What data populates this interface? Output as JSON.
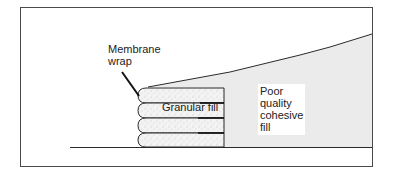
{
  "diagram": {
    "title": "",
    "labels": {
      "membrane": [
        "Membrane",
        "wrap"
      ],
      "granular": "Granular fill",
      "cohesive": [
        "Poor",
        "quality",
        "cohesive",
        "fill"
      ]
    },
    "colors": {
      "frame": "#4a4a4a",
      "line": "#2a2a2a",
      "cohesive_fill": "#ebebeb",
      "granular_fill": "#f2f2f2",
      "background": "#ffffff"
    },
    "wrap_layers": 4
  }
}
